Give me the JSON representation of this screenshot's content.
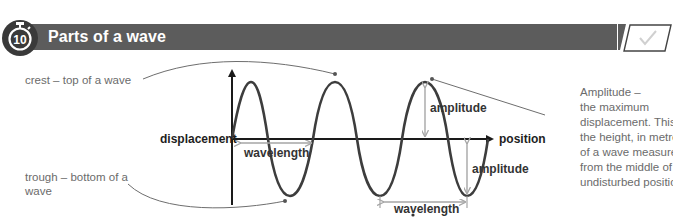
{
  "header": {
    "activity_number": "10",
    "title": "Parts of a wave",
    "colors": {
      "bar": "#5c5c5c",
      "title_text": "#ffffff",
      "icon_bg": "#3a3a3a"
    }
  },
  "diagram": {
    "axes": {
      "y_label": "displacement",
      "x_label": "position"
    },
    "annotations": {
      "crest": "crest – top of a wave",
      "trough_line1": "trough – bottom of a",
      "trough_line2": "wave",
      "wavelength_1": "wavelength",
      "wavelength_2": "wavelength",
      "amplitude_1": "amplitude",
      "amplitude_2": "amplitude"
    },
    "amplitude_definition": {
      "lines": [
        "Amplitude –",
        "the maximum",
        "displacement. This is",
        "the height, in metres,",
        "of a wave measured",
        "from the middle of the",
        "undisturbed position."
      ]
    },
    "colors": {
      "wave": "#3d3d3d",
      "axis": "#1a1a1a",
      "arrow": "#a6a6a6",
      "leader": "#6e6e6e",
      "text": "#6b6b6b"
    }
  },
  "checkbox": {
    "icon": "check-icon",
    "checked": false
  }
}
